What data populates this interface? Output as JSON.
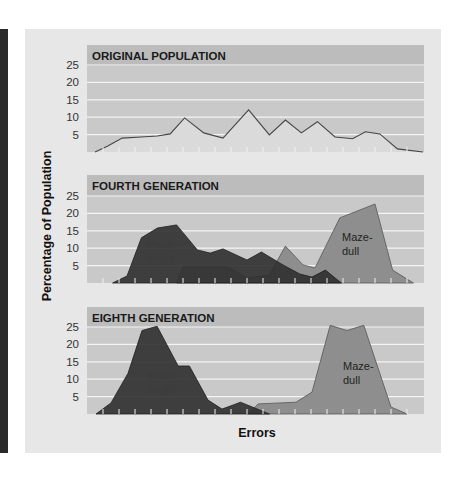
{
  "chart_data": [
    {
      "type": "area",
      "title": "ORIGINAL POPULATION",
      "xlabel": "Errors",
      "ylabel": "Percentage of Population",
      "yticks": [
        5,
        10,
        15,
        20,
        25
      ],
      "ylim": [
        0,
        25
      ],
      "grid": true,
      "series": [
        {
          "name": "Original population",
          "x": [
            0.5,
            1.3,
            2.2,
            3.4,
            4.4,
            5.2,
            6.1,
            7.3,
            8.5,
            10.1,
            11.4,
            12.4,
            13.4,
            14.4,
            15.5,
            16.6,
            17.4,
            18.3,
            19.4,
            21.0
          ],
          "values": [
            0,
            1.7,
            4,
            4.3,
            4.6,
            5.2,
            9.8,
            5.5,
            4,
            12.1,
            4.9,
            9.2,
            5.5,
            8.7,
            4.3,
            3.8,
            5.8,
            5.2,
            0.9,
            0
          ]
        }
      ]
    },
    {
      "type": "area",
      "title": "FOURTH GENERATION",
      "xlabel": "Errors",
      "ylabel": "Percentage of Population",
      "yticks": [
        5,
        10,
        15,
        20,
        25
      ],
      "ylim": [
        0,
        25
      ],
      "grid": true,
      "series": [
        {
          "name": "Maze-dull",
          "x": [
            5.6,
            6.0,
            8.8,
            10.0,
            11.4,
            12.4,
            13.5,
            14.25,
            15.8,
            18.0,
            19.1,
            20.4
          ],
          "values": [
            0,
            4.6,
            4.6,
            1.4,
            2.3,
            10.6,
            5.2,
            4.3,
            18.7,
            22.7,
            3.7,
            0
          ]
        },
        {
          "name": "Maze-bright",
          "x": [
            1.6,
            2.5,
            3.4,
            4.4,
            5.6,
            6.9,
            7.7,
            8.5,
            10.0,
            10.9,
            12.25,
            13.3,
            14.06,
            14.9,
            15.9
          ],
          "values": [
            0,
            2,
            13,
            15.8,
            16.7,
            9.5,
            8.6,
            9.8,
            6.6,
            8.9,
            5.2,
            2.6,
            1.7,
            3.7,
            0
          ]
        }
      ]
    },
    {
      "type": "area",
      "title": "EIGHTH GENERATION",
      "xlabel": "Errors",
      "ylabel": "Percentage of Population",
      "yticks": [
        5,
        10,
        15,
        20,
        25
      ],
      "ylim": [
        0,
        25
      ],
      "grid": true,
      "series": [
        {
          "name": "Maze-dull",
          "x": [
            10.06,
            10.7,
            13.06,
            14.06,
            15.2,
            16.25,
            17.3,
            19.0,
            20.0
          ],
          "values": [
            0,
            2.9,
            3.4,
            6.3,
            25.5,
            24,
            25.5,
            2,
            0
          ]
        },
        {
          "name": "Maze-bright",
          "x": [
            0.56,
            1.5,
            2.56,
            3.44,
            4.38,
            5.7,
            6.4,
            7.56,
            8.44,
            9.6,
            11.4
          ],
          "values": [
            0,
            3.2,
            11.7,
            24,
            25.2,
            13.8,
            13.8,
            4,
            1.4,
            3.4,
            0
          ]
        }
      ]
    }
  ],
  "labels": {
    "ylabel": "Percentage of Population",
    "xlabel": "Errors",
    "panel1_title": "ORIGINAL POPULATION",
    "panel2_title": "FOURTH GENERATION",
    "panel3_title": "EIGHTH GENERATION",
    "maze_bright_line1": "Maze-",
    "maze_bright_line2": "bright",
    "maze_dull_line1": "Maze-",
    "maze_dull_line2": "dull",
    "yticks": [
      "25",
      "20",
      "15",
      "10",
      "5"
    ]
  },
  "colors": {
    "panel_bg": "#e7e7e7",
    "plot_bg": "#c9c9c9",
    "title_band": "#bcbcbc",
    "gridline": "#f4f4f4",
    "original_fill": "#dadada",
    "original_line": "#454545",
    "maze_bright": "#2f2f2f",
    "maze_dull": "#8e8e8e",
    "side_bar": "#2a2a2a"
  }
}
